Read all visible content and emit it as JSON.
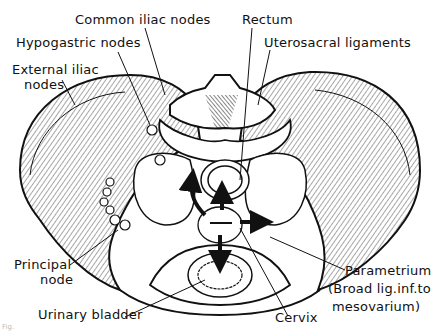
{
  "figure": {
    "caption_fragment": "Fig."
  },
  "labels": {
    "common_iliac": "Common iliac nodes",
    "hypogastric": "Hypogastric nodes",
    "external_iliac_1": "External iliac",
    "external_iliac_2": "nodes",
    "rectum": "Rectum",
    "uterosacral": "Uterosacral ligaments",
    "principal_1": "Principal",
    "principal_2": "node",
    "urinary_bladder": "Urinary bladder",
    "cervix": "Cervix",
    "parametrium_1": "Parametrium",
    "parametrium_2": "(Broad lig.inf.to",
    "parametrium_3": "mesovarium)"
  },
  "arrows": [
    {
      "from": "cervix",
      "direction": "up",
      "target": "rectum"
    },
    {
      "from": "cervix",
      "direction": "up-left",
      "target": "uterosacral"
    },
    {
      "from": "cervix",
      "direction": "right",
      "target": "parametrium"
    },
    {
      "from": "cervix",
      "direction": "down",
      "target": "urinary bladder"
    }
  ],
  "colors": {
    "ink": "#111111",
    "paper": "#ffffff"
  }
}
